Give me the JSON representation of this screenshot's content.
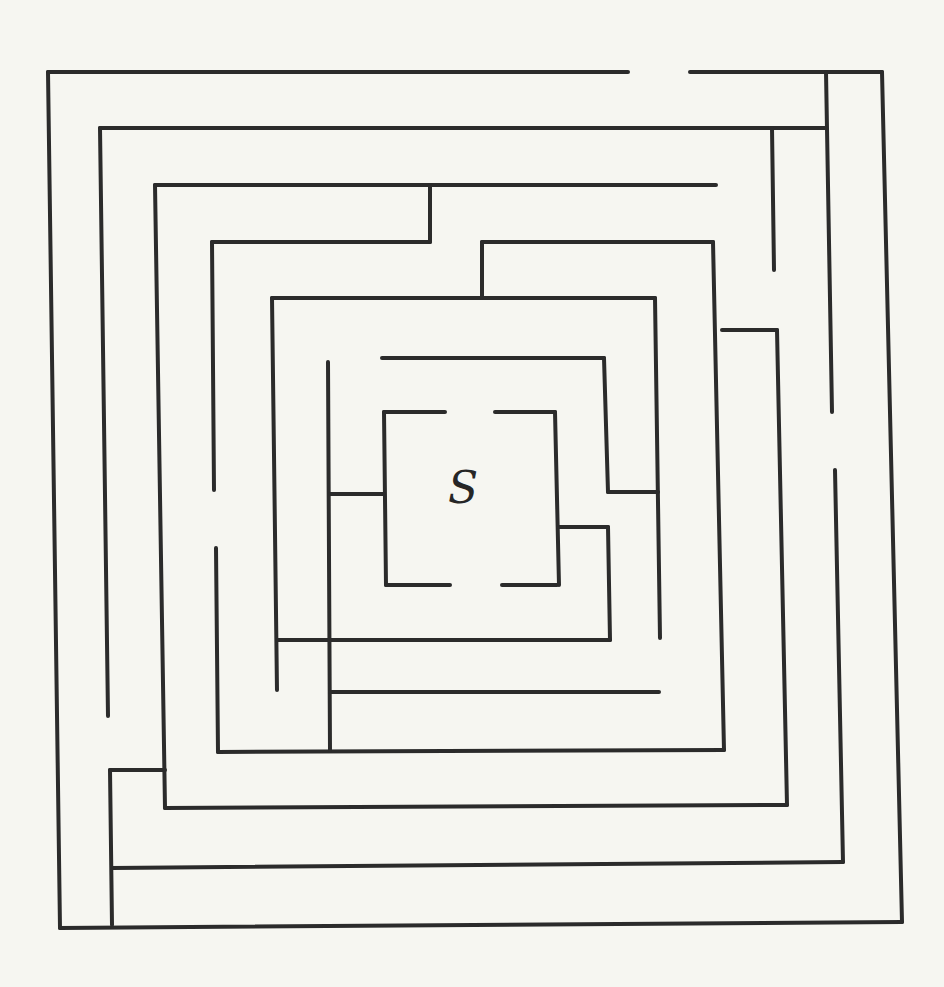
{
  "puzzle": {
    "type": "maze",
    "start_label": "S",
    "wall_color": "#2b2b2b",
    "paper_color": "#f6f6f1"
  }
}
